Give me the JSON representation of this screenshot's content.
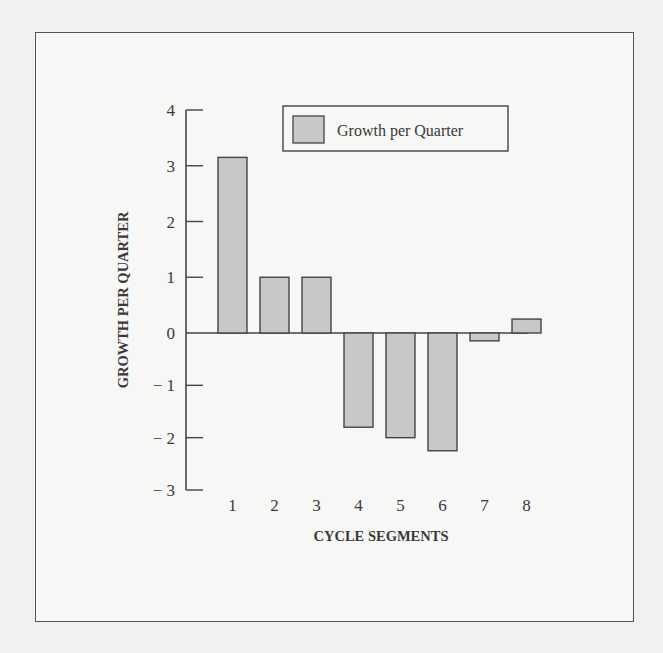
{
  "chart_data": {
    "type": "bar",
    "title": "",
    "xlabel": "CYCLE SEGMENTS",
    "ylabel": "GROWTH PER QUARTER",
    "categories": [
      "1",
      "2",
      "3",
      "4",
      "5",
      "6",
      "7",
      "8"
    ],
    "series": [
      {
        "name": "Growth per Quarter",
        "values": [
          3.15,
          1.0,
          1.0,
          -1.8,
          -2.0,
          -2.25,
          -0.15,
          0.25
        ]
      }
    ],
    "yticks": [
      "4",
      "3",
      "2",
      "1",
      "0",
      "− 1",
      "− 2",
      "− 3"
    ],
    "ylim": [
      -3,
      4
    ],
    "grid": false,
    "legend_position": "top-right",
    "bar_color": "#c8c8c8",
    "bar_edge_color": "#444444"
  },
  "legend": {
    "label": "Growth per Quarter"
  }
}
